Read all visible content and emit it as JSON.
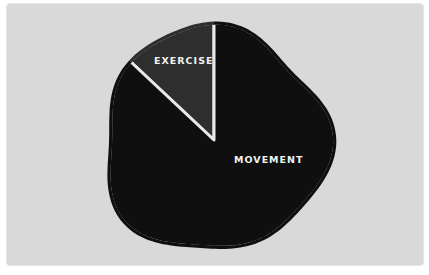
{
  "chart_data": {
    "type": "pie",
    "title": "",
    "slices": [
      {
        "label": "EXERCISE",
        "value": 13,
        "color": "#2e2e2e"
      },
      {
        "label": "MOVEMENT",
        "value": 87,
        "color": "#0f0f0f"
      }
    ],
    "start": "top",
    "direction": "counterclockwise",
    "separator_color": "#e8e8e8",
    "background_color": "#d9d9d9",
    "legend": "none"
  }
}
